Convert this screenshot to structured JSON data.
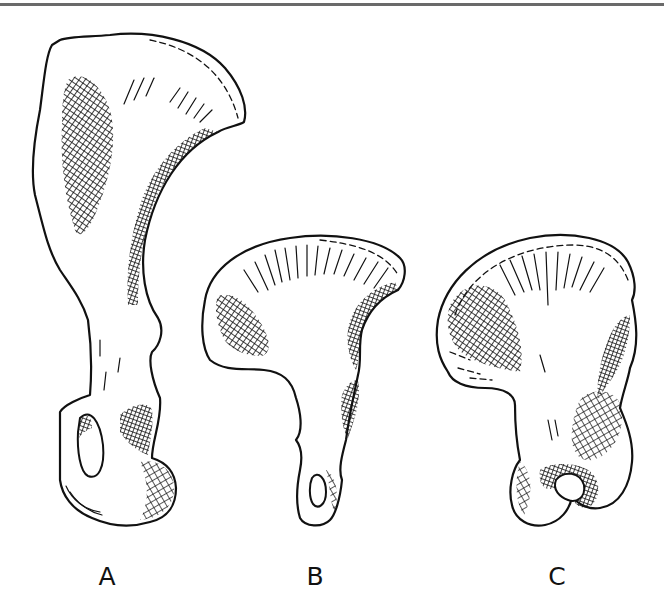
{
  "figure": {
    "rule_color": "#6a6a6a",
    "ink_color": "#111111",
    "background": "#ffffff"
  },
  "specimens": [
    {
      "id": "A",
      "label": "A"
    },
    {
      "id": "B",
      "label": "B"
    },
    {
      "id": "C",
      "label": "C"
    }
  ]
}
